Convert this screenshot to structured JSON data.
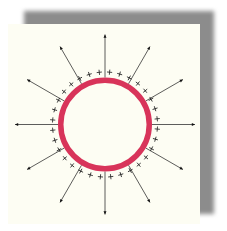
{
  "diagram": {
    "colors": {
      "background": "#ffffff",
      "panel": "#fdfdf3",
      "shadow": "#8c8c8c",
      "shell": "#d8345a",
      "shell_inner": "#ffffff",
      "field_line": "#333333",
      "charge": "#222222"
    },
    "center": {
      "x": 105,
      "y": 124.5
    },
    "shell": {
      "outer_radius": 47,
      "thickness": 5.5
    },
    "field_lines": {
      "count": 12,
      "start_radius": 47,
      "end_radius": 90,
      "angle_step_deg": 30
    },
    "charges": {
      "count": 32,
      "symbol": "+",
      "radius": 52.5
    }
  }
}
